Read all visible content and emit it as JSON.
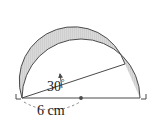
{
  "figure": {
    "kind": "geometry-diagram",
    "background_color": "#ffffff",
    "stroke_color": "#4a4a4a",
    "shade_fill_color": "#d4d4d4",
    "shade_hatch_color": "#bdbdbd",
    "labels": {
      "angle_value": "30",
      "angle_degree_symbol": "°",
      "length_value": "6 cm"
    },
    "markers": {
      "center_dot": "center-point-dot",
      "left_corner": "right-angle-mark-left",
      "right_corner": "right-angle-mark-right",
      "angle_arrow": "angle-indicator-arrow"
    },
    "points": {
      "left_vertex": [
        22,
        98
      ],
      "right_vertex": [
        140,
        98
      ],
      "center": [
        81,
        98
      ],
      "chord_end": [
        125,
        64
      ],
      "apex": [
        81,
        10
      ]
    },
    "radius_px": 59,
    "chord_angle_degrees": 30
  }
}
